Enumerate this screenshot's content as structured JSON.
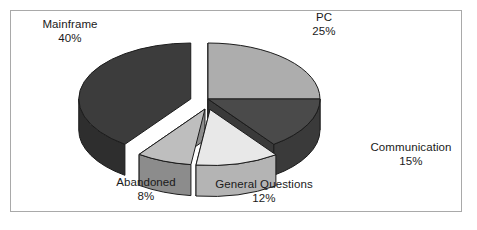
{
  "page": {
    "background": "#ffffff",
    "frame_color": "#a9a9a9",
    "text_color": "#1a1a1a"
  },
  "chart_data": {
    "type": "pie",
    "title": "",
    "subtitle": "",
    "xlabel": "",
    "ylabel": "",
    "style": "3d-exploded-pie",
    "legend_position": "none",
    "grid": false,
    "units": "%",
    "total": 100,
    "categories": [
      "Mainframe",
      "PC",
      "Communication",
      "General Questions",
      "Abandoned"
    ],
    "values": [
      40,
      25,
      15,
      12,
      8
    ],
    "slices": [
      {
        "label": "Mainframe",
        "value": 40,
        "percent_text": "40%",
        "top_color": "#3c3c3c",
        "side_color": "#2e2e2e",
        "exploded": true
      },
      {
        "label": "PC",
        "value": 25,
        "percent_text": "25%",
        "top_color": "#adadad",
        "side_color": "#7d7d7d",
        "exploded": false
      },
      {
        "label": "Communication",
        "value": 15,
        "percent_text": "15%",
        "top_color": "#4a4a4a",
        "side_color": "#3a3a3a",
        "exploded": false
      },
      {
        "label": "General Questions",
        "value": 12,
        "percent_text": "12%",
        "top_color": "#e8e8e8",
        "side_color": "#b4b4b4",
        "exploded": true
      },
      {
        "label": "Abandoned",
        "value": 8,
        "percent_text": "8%",
        "top_color": "#bebebe",
        "side_color": "#8c8c8c",
        "exploded": true
      }
    ]
  },
  "labels": {
    "mainframe": {
      "name": "Mainframe",
      "percent": "40%"
    },
    "pc": {
      "name": "PC",
      "percent": "25%"
    },
    "communication": {
      "name": "Communication",
      "percent": "15%"
    },
    "general_questions": {
      "name": "General Questions",
      "percent": "12%"
    },
    "abandoned": {
      "name": "Abandoned",
      "percent": "8%"
    }
  }
}
